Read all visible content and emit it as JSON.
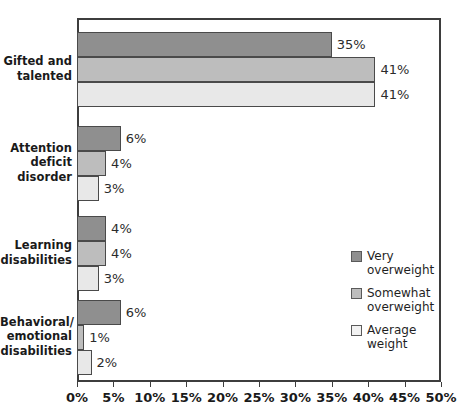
{
  "chart_data": {
    "type": "bar",
    "orientation": "horizontal",
    "title": "",
    "xlabel": "",
    "ylabel": "",
    "xlim": [
      0,
      50
    ],
    "xtick_labels": [
      "0%",
      "5%",
      "10%",
      "15%",
      "20%",
      "25%",
      "30%",
      "35%",
      "40%",
      "45%",
      "50%"
    ],
    "xtick_values": [
      0,
      5,
      10,
      15,
      20,
      25,
      30,
      35,
      40,
      45,
      50
    ],
    "grid": false,
    "legend_position": "inside-right",
    "categories": [
      "Gifted and\ntalented",
      "Attention\ndeficit\ndisorder",
      "Learning\ndisabilities",
      "Behavioral/\nemotional\ndisabilities"
    ],
    "series": [
      {
        "name": "Very\noverweight",
        "color": "#8f8f8f",
        "values": [
          35,
          6,
          4,
          6
        ],
        "labels": [
          "35%",
          "6%",
          "4%",
          "6%"
        ]
      },
      {
        "name": "Somewhat\noverweight",
        "color": "#bdbdbd",
        "values": [
          41,
          4,
          4,
          1
        ],
        "labels": [
          "41%",
          "4%",
          "4%",
          "1%"
        ]
      },
      {
        "name": "Average\nweight",
        "color": "#e8e8e8",
        "values": [
          41,
          3,
          3,
          2
        ],
        "labels": [
          "41%",
          "3%",
          "3%",
          "2%"
        ]
      }
    ]
  }
}
